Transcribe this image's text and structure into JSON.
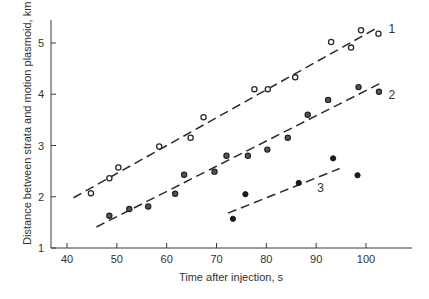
{
  "chart_data": {
    "type": "scatter",
    "title": "",
    "xlabel": "Time after injection, s",
    "ylabel": "Distance between strata and motion plasmoid, km",
    "xlim": [
      37,
      109
    ],
    "ylim": [
      1,
      5.5
    ],
    "x_ticks": [
      40,
      50,
      60,
      70,
      80,
      90,
      100
    ],
    "y_ticks": [
      1,
      2,
      3,
      4,
      5
    ],
    "grid": false,
    "legend": "inline numeric labels at line ends",
    "series": [
      {
        "name": "1",
        "marker": "open-circle",
        "points": [
          [
            44.8,
            2.07
          ],
          [
            48.5,
            2.36
          ],
          [
            50.3,
            2.57
          ],
          [
            58.5,
            2.98
          ],
          [
            64.8,
            3.15
          ],
          [
            67.4,
            3.55
          ],
          [
            77.6,
            4.1
          ],
          [
            80.3,
            4.1
          ],
          [
            85.8,
            4.33
          ],
          [
            93.0,
            5.02
          ],
          [
            97.0,
            4.91
          ],
          [
            99.0,
            5.25
          ],
          [
            102.5,
            5.18
          ]
        ],
        "fit_line": [
          [
            41.3,
            1.98
          ],
          [
            102.3,
            5.3
          ]
        ],
        "label_pos": [
          104.5,
          5.28
        ]
      },
      {
        "name": "2",
        "marker": "half-filled-circle",
        "points": [
          [
            48.5,
            1.63
          ],
          [
            52.5,
            1.76
          ],
          [
            56.3,
            1.81
          ],
          [
            61.7,
            2.06
          ],
          [
            63.5,
            2.43
          ],
          [
            69.6,
            2.49
          ],
          [
            72.0,
            2.8
          ],
          [
            76.3,
            2.8
          ],
          [
            80.2,
            2.92
          ],
          [
            84.3,
            3.15
          ],
          [
            88.3,
            3.6
          ],
          [
            92.4,
            3.89
          ],
          [
            98.5,
            4.14
          ],
          [
            102.6,
            4.05
          ]
        ],
        "fit_line": [
          [
            45.9,
            1.41
          ],
          [
            103.0,
            4.22
          ]
        ],
        "label_pos": [
          104.5,
          3.98
        ]
      },
      {
        "name": "3",
        "marker": "filled-circle",
        "points": [
          [
            73.3,
            1.57
          ],
          [
            75.8,
            2.05
          ],
          [
            86.5,
            2.27
          ],
          [
            93.4,
            2.75
          ],
          [
            98.3,
            2.42
          ]
        ],
        "fit_line": [
          [
            72.3,
            1.68
          ],
          [
            94.7,
            2.55
          ]
        ],
        "label_pos": [
          90.2,
          2.17
        ]
      }
    ]
  }
}
